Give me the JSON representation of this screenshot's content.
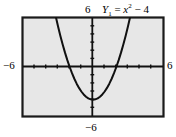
{
  "figure": {
    "name": "graphing-calculator-window",
    "equation_label": {
      "series": "Y",
      "series_index": "1",
      "equals": "=",
      "variable": "x",
      "exponent": "2",
      "operator": "−",
      "constant": "4",
      "full_text": "Y1 = x2 − 4"
    },
    "axis_labels": {
      "top": "6",
      "left": "−6",
      "right": "6",
      "bottom": "−6"
    },
    "colors": {
      "frame": "#1a1a1a",
      "plot_background": "#e7e7e7",
      "curve": "#111111",
      "axis": "#111111",
      "label_text": "#000000",
      "page_background": "#ffffff"
    }
  },
  "chart_data": {
    "type": "line",
    "xlabel": "",
    "ylabel": "",
    "xlim": [
      -6,
      6
    ],
    "ylim": [
      -6,
      6
    ],
    "grid": false,
    "legend": "none",
    "xticks": [
      -6,
      -5,
      -4,
      -3,
      -2,
      -1,
      0,
      1,
      2,
      3,
      4,
      5,
      6
    ],
    "yticks": [
      -6,
      -5,
      -4,
      -3,
      -2,
      -1,
      0,
      1,
      2,
      3,
      4,
      5,
      6
    ],
    "xtick_labels": [
      "−6",
      "",
      "",
      "",
      "",
      "",
      "",
      "",
      "",
      "",
      "",
      "",
      "6"
    ],
    "ytick_labels": [
      "−6",
      "",
      "",
      "",
      "",
      "",
      "",
      "",
      "",
      "",
      "",
      "",
      "6"
    ],
    "annotations": [
      "Y1 = x² − 4"
    ],
    "series": [
      {
        "name": "Y1 = x² − 4",
        "expression": "y = x^2 - 4",
        "vertex": [
          0,
          -4
        ],
        "roots": [
          -2,
          2
        ],
        "x": [
          -3.1623,
          -3.0,
          -2.8,
          -2.6,
          -2.4,
          -2.2,
          -2.0,
          -1.8,
          -1.6,
          -1.4,
          -1.2,
          -1.0,
          -0.8,
          -0.6,
          -0.4,
          -0.2,
          0.0,
          0.2,
          0.4,
          0.6,
          0.8,
          1.0,
          1.2,
          1.4,
          1.6,
          1.8,
          2.0,
          2.2,
          2.4,
          2.6,
          2.8,
          3.0,
          3.1623
        ],
        "y": [
          6.0,
          5.0,
          3.84,
          2.76,
          1.76,
          0.84,
          0.0,
          -0.76,
          -1.44,
          -2.04,
          -2.56,
          -3.0,
          -3.36,
          -3.64,
          -3.84,
          -3.96,
          -4.0,
          -3.96,
          -3.84,
          -3.64,
          -3.36,
          -3.0,
          -2.56,
          -2.04,
          -1.44,
          -0.76,
          0.0,
          0.84,
          1.76,
          2.76,
          3.84,
          5.0,
          6.0
        ]
      }
    ]
  }
}
